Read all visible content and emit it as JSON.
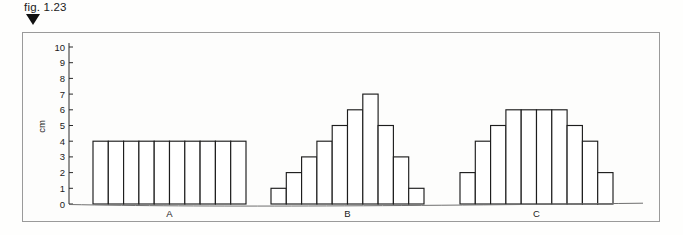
{
  "figure": {
    "caption": "fig. 1.23",
    "marker_icon": "down-triangle-marker"
  },
  "chart_data": {
    "type": "bar",
    "title": "",
    "subtitle": "",
    "xlabel": "",
    "ylabel": "cm",
    "ylim": [
      0,
      10
    ],
    "y_ticks": [
      0,
      1,
      2,
      3,
      4,
      5,
      6,
      7,
      8,
      9,
      10
    ],
    "y_tick_labels": [
      "0",
      "1",
      "2",
      "3",
      "4",
      "5",
      "6",
      "7",
      "8",
      "9",
      "10"
    ],
    "grid": false,
    "legend": false,
    "group_labels": [
      "A",
      "B",
      "C"
    ],
    "bars_per_group": 10,
    "series": [
      {
        "name": "A",
        "label": "A",
        "values": [
          4,
          4,
          4,
          4,
          4,
          4,
          4,
          4,
          4,
          4
        ]
      },
      {
        "name": "B",
        "label": "B",
        "values": [
          1,
          2,
          3,
          4,
          5,
          6,
          7,
          5,
          3,
          1
        ]
      },
      {
        "name": "C",
        "label": "C",
        "values": [
          2,
          4,
          5,
          6,
          6,
          6,
          6,
          5,
          4,
          2
        ]
      }
    ]
  },
  "colors": {
    "bar_stroke": "#1d1d1d",
    "bar_fill": "#ffffff",
    "axis": "#2a2a2a",
    "frame": "#9a9a9a",
    "page_background": "#fefefd",
    "text": "#1b1b1b"
  }
}
